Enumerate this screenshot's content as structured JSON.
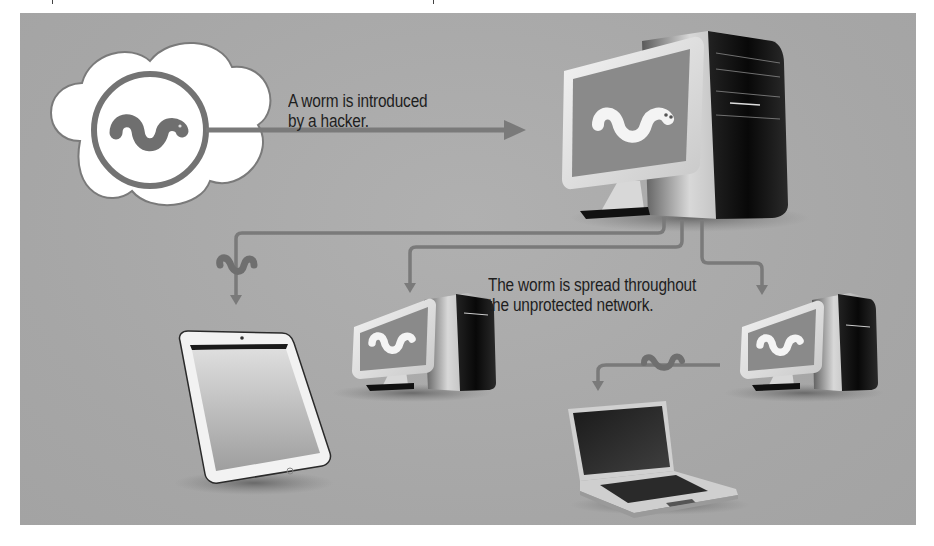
{
  "diagram": {
    "type": "worm-propagation-illustration",
    "colors": {
      "background_panel": "#a9a9a9",
      "arrow": "#7a7a7a",
      "worm_gray": "#6f6f6f",
      "worm_white": "#f4f4f4",
      "cloud": "#ffffff",
      "text": "#1e1e1e"
    },
    "captions": {
      "introduced_line1": "A worm is introduced",
      "introduced_line2": "by a hacker.",
      "spread_line1": "The worm is spread throughout",
      "spread_line2": "the unprotected network."
    },
    "nodes": [
      {
        "id": "hacker-cloud",
        "label": "Cloud with worm icon (hacker source)"
      },
      {
        "id": "main-computer",
        "label": "Main desktop computer showing worm"
      },
      {
        "id": "tablet",
        "label": "Tablet device"
      },
      {
        "id": "desktop-2",
        "label": "Desktop computer showing worm"
      },
      {
        "id": "desktop-3",
        "label": "Desktop computer showing worm"
      },
      {
        "id": "laptop",
        "label": "Laptop computer"
      }
    ],
    "edges": [
      {
        "from": "hacker-cloud",
        "to": "main-computer"
      },
      {
        "from": "main-computer",
        "to": "tablet",
        "worm_on_line": true
      },
      {
        "from": "main-computer",
        "to": "desktop-2"
      },
      {
        "from": "main-computer",
        "to": "desktop-3"
      },
      {
        "from": "desktop-3",
        "to": "laptop",
        "worm_on_line": true
      }
    ]
  }
}
